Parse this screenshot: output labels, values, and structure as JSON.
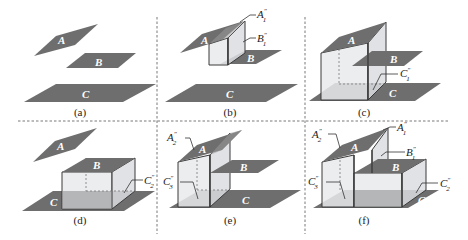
{
  "figure": {
    "separators": {
      "style": "dashed",
      "color": "#555555"
    },
    "colors": {
      "plane": "#6e6e6e",
      "prism_face": "#e9eaec",
      "background": "#ffffff"
    },
    "panels": [
      {
        "id": "a",
        "caption": "(a)",
        "planes": [
          "A",
          "B",
          "C"
        ],
        "annotations": []
      },
      {
        "id": "b",
        "caption": "(b)",
        "planes": [
          "A",
          "B",
          "C"
        ],
        "annotations": [
          {
            "base": "A",
            "sup": "″",
            "sub": "1"
          },
          {
            "base": "B",
            "sup": "″",
            "sub": "1"
          }
        ]
      },
      {
        "id": "c",
        "caption": "(c)",
        "planes": [
          "A",
          "B",
          "C"
        ],
        "annotations": [
          {
            "base": "C",
            "sup": "″",
            "sub": "1"
          }
        ]
      },
      {
        "id": "d",
        "caption": "(d)",
        "planes": [
          "A",
          "B",
          "C"
        ],
        "annotations": [
          {
            "base": "C",
            "sup": "″",
            "sub": "2"
          }
        ]
      },
      {
        "id": "e",
        "caption": "(e)",
        "planes": [
          "A",
          "B",
          "C"
        ],
        "annotations": [
          {
            "base": "A",
            "sup": "″",
            "sub": "2"
          },
          {
            "base": "C",
            "sup": "″",
            "sub": "3"
          }
        ]
      },
      {
        "id": "f",
        "caption": "(f)",
        "planes": [
          "A",
          "B",
          "C"
        ],
        "annotations": [
          {
            "base": "A",
            "sup": "″",
            "sub": "2"
          },
          {
            "base": "A",
            "sup": "″",
            "sub": "1"
          },
          {
            "base": "B",
            "sup": "″",
            "sub": "1"
          },
          {
            "base": "C",
            "sup": "″",
            "sub": "3"
          },
          {
            "base": "C",
            "sup": "″",
            "sub": "2"
          }
        ]
      }
    ]
  }
}
